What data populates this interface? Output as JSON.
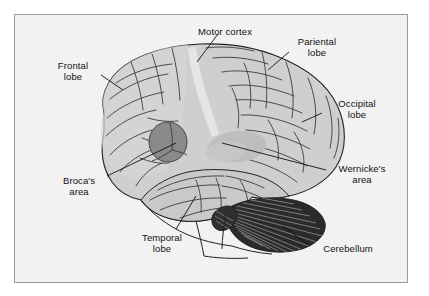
{
  "figure": {
    "background_color": "#ffffff",
    "panel_color": "#f2f2f2",
    "border_color": "#9a9a9a"
  },
  "colors": {
    "brain_fill": "#cfcfcf",
    "brain_fill_light": "#dcdcdc",
    "brain_outline": "#222222",
    "sulci_line": "#333333",
    "brocas_fill": "#8a8a8a",
    "wernickes_fill": "#bdbdbd",
    "cerebellum_fill": "#2b2b2b",
    "cerebellum_stripe": "#cccccc",
    "leader_line": "#111111",
    "label_text": "#111111"
  },
  "labels": [
    {
      "id": "motor-cortex",
      "text": "Motor cortex",
      "x": 186,
      "y": 26,
      "w": 78
    },
    {
      "id": "pariental-lobe",
      "text": "Pariental\nlobe",
      "x": 286,
      "y": 36,
      "w": 62
    },
    {
      "id": "frontal-lobe",
      "text": "Frontal\nlobe",
      "x": 44,
      "y": 60,
      "w": 58
    },
    {
      "id": "occipital-lobe",
      "text": "Occipital\nlobe",
      "x": 325,
      "y": 98,
      "w": 64
    },
    {
      "id": "wernickes-area",
      "text": "Wernicke's\narea",
      "x": 328,
      "y": 163,
      "w": 68
    },
    {
      "id": "brocas-area",
      "text": "Broca's\narea",
      "x": 51,
      "y": 175,
      "w": 56
    },
    {
      "id": "temporal-lobe",
      "text": "Temporal\nlobe",
      "x": 131,
      "y": 232,
      "w": 62
    },
    {
      "id": "cerebellum",
      "text": "Cerebellum",
      "x": 313,
      "y": 243,
      "w": 70
    }
  ],
  "regions": [
    {
      "id": "brocas-area",
      "name": "Broca's area",
      "shade": "dark-grey"
    },
    {
      "id": "wernickes-area",
      "name": "Wernicke's area",
      "shade": "light-grey"
    },
    {
      "id": "cerebellum",
      "name": "Cerebellum",
      "shade": "black-hatched"
    },
    {
      "id": "frontal-lobe",
      "name": "Frontal lobe",
      "shade": "grey"
    },
    {
      "id": "pariental-lobe",
      "name": "Pariental lobe",
      "shade": "grey"
    },
    {
      "id": "occipital-lobe",
      "name": "Occipital lobe",
      "shade": "grey"
    },
    {
      "id": "temporal-lobe",
      "name": "Temporal lobe",
      "shade": "grey"
    },
    {
      "id": "motor-cortex",
      "name": "Motor cortex",
      "shade": "light-band"
    }
  ]
}
